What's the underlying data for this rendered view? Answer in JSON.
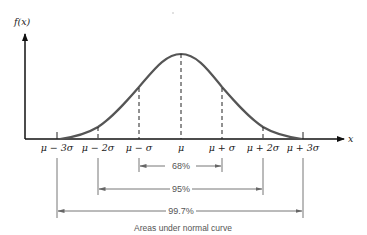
{
  "diagram": {
    "y_axis_label": "f(x)",
    "x_axis_label": "x",
    "curve": "normal distribution",
    "x_ticks": [
      {
        "label": "μ − 3σ",
        "x": 57
      },
      {
        "label": "μ − 2σ",
        "x": 98
      },
      {
        "label": "μ − σ",
        "x": 139
      },
      {
        "label": "μ",
        "x": 181
      },
      {
        "label": "μ + σ",
        "x": 222
      },
      {
        "label": "μ + 2σ",
        "x": 263
      },
      {
        "label": "μ + 3σ",
        "x": 303
      }
    ],
    "ranges": [
      {
        "label": "68%",
        "from": "μ − σ",
        "to": "μ + σ"
      },
      {
        "label": "95%",
        "from": "μ − 2σ",
        "to": "μ + 2σ"
      },
      {
        "label": "99.7%",
        "from": "μ − 3σ",
        "to": "μ + 3σ"
      }
    ],
    "caption": "Areas under normal curve"
  }
}
